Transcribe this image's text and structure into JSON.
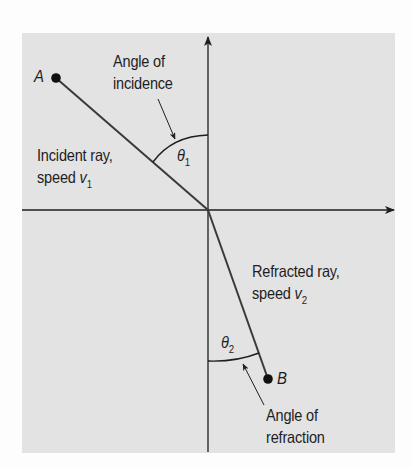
{
  "diagram": {
    "colors": {
      "panel_background": "#e3e3e3",
      "page_background": "#fdfdfd",
      "ink": "#1e1e1e",
      "ray": "#3a3a3a"
    },
    "axes": {
      "origin": [
        208,
        210
      ],
      "horizontal": {
        "x_start": 22,
        "x_end": 395,
        "arrow": "right"
      },
      "vertical": {
        "y_start": 451,
        "y_end": 36,
        "arrow": "up"
      }
    },
    "points": [
      {
        "id": "A",
        "label": "A",
        "position": [
          56,
          78
        ]
      },
      {
        "id": "B",
        "label": "B",
        "position": [
          268,
          379
        ]
      }
    ],
    "rays": [
      {
        "id": "incident",
        "from": "A",
        "to": "origin"
      },
      {
        "id": "refracted",
        "from": "origin",
        "to": "B"
      }
    ],
    "angles": [
      {
        "id": "theta1",
        "symbol": "θ",
        "subscript": "1",
        "between": [
          "incident ray",
          "normal (up)"
        ]
      },
      {
        "id": "theta2",
        "symbol": "θ",
        "subscript": "2",
        "between": [
          "refracted ray",
          "normal (down)"
        ]
      }
    ],
    "labels": {
      "angle_of_incidence": {
        "line1": "Angle of",
        "line2": "incidence"
      },
      "incident_ray": {
        "line1": "Incident ray,",
        "line2_prefix": "speed ",
        "var": "v",
        "sub": "1"
      },
      "refracted_ray": {
        "line1": "Refracted ray,",
        "line2_prefix": "speed ",
        "var": "v",
        "sub": "2"
      },
      "angle_of_refraction": {
        "line1": "Angle of",
        "line2": "refraction"
      },
      "point_a": "A",
      "point_b": "B",
      "theta1": {
        "symbol": "θ",
        "sub": "1"
      },
      "theta2": {
        "symbol": "θ",
        "sub": "2"
      }
    }
  }
}
